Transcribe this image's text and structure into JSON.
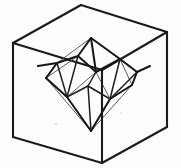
{
  "figure": {
    "title": "Icosahedron inscribed in a cube",
    "background_color": "#fdfdfc",
    "ink_color": "#1b1b1b",
    "width": 181,
    "height": 168,
    "style": "pen-and-ink wireframe diagram",
    "outer_solid": {
      "name": "cube",
      "vertex_count": 8,
      "edge_count": 12,
      "visible_edges": 9,
      "hidden_edges": 3
    },
    "inner_solid": {
      "name": "icosahedron",
      "vertex_count": 12,
      "edge_count": 30,
      "face_count": 20
    }
  },
  "geometry": {
    "cube_vertices": {
      "top_back_left": [
        13,
        43
      ],
      "top_back_right": [
        81,
        5
      ],
      "top_front_right": [
        167,
        32
      ],
      "top_front_left": [
        102,
        70
      ],
      "bottom_back_left": [
        13,
        137
      ],
      "bottom_back_right": [
        81,
        99
      ],
      "bottom_front_right": [
        167,
        127
      ],
      "bottom_front_left": [
        102,
        163
      ]
    },
    "cube_edges_visible": [
      [
        "top_back_left",
        "top_back_right"
      ],
      [
        "top_back_right",
        "top_front_right"
      ],
      [
        "top_front_right",
        "top_front_left"
      ],
      [
        "top_front_left",
        "top_back_left"
      ],
      [
        "top_back_left",
        "bottom_back_left"
      ],
      [
        "top_front_right",
        "bottom_front_right"
      ],
      [
        "top_front_left",
        "bottom_front_left"
      ],
      [
        "bottom_back_left",
        "bottom_front_left"
      ],
      [
        "bottom_front_left",
        "bottom_front_right"
      ]
    ],
    "cube_edges_hidden": [
      [
        "top_back_right",
        "bottom_back_right"
      ],
      [
        "bottom_back_left",
        "bottom_back_right"
      ],
      [
        "bottom_back_right",
        "bottom_front_right"
      ]
    ],
    "icosahedron_vertices": {
      "apex_top": [
        91,
        38
      ],
      "apex_bottom": [
        91,
        131
      ],
      "upper_a": [
        57,
        63
      ],
      "upper_b": [
        78,
        56
      ],
      "upper_c": [
        120,
        59
      ],
      "upper_d": [
        137,
        72
      ],
      "upper_e": [
        96,
        72
      ],
      "lower_a": [
        46,
        78
      ],
      "lower_b": [
        67,
        97
      ],
      "lower_c": [
        110,
        99
      ],
      "lower_d": [
        132,
        85
      ],
      "lower_e": [
        88,
        86
      ]
    },
    "icosahedron_edges_front": [
      [
        "apex_top",
        "upper_b"
      ],
      [
        "apex_top",
        "upper_c"
      ],
      [
        "apex_top",
        "upper_e"
      ],
      [
        "upper_a",
        "upper_b"
      ],
      [
        "upper_c",
        "upper_d"
      ],
      [
        "upper_a",
        "lower_a"
      ],
      [
        "upper_d",
        "lower_d"
      ],
      [
        "lower_a",
        "lower_b"
      ],
      [
        "lower_c",
        "lower_d"
      ],
      [
        "lower_b",
        "apex_bottom"
      ],
      [
        "lower_c",
        "apex_bottom"
      ],
      [
        "upper_b",
        "upper_e"
      ],
      [
        "upper_c",
        "upper_e"
      ],
      [
        "lower_b",
        "lower_e"
      ],
      [
        "lower_c",
        "lower_e"
      ],
      [
        "upper_e",
        "lower_e"
      ]
    ],
    "icosahedron_edges_back": [
      [
        "upper_a",
        "apex_top"
      ],
      [
        "upper_d",
        "apex_top"
      ],
      [
        "lower_a",
        "apex_bottom"
      ],
      [
        "lower_d",
        "apex_bottom"
      ],
      [
        "upper_a",
        "lower_b"
      ],
      [
        "upper_b",
        "lower_b"
      ],
      [
        "upper_c",
        "lower_c"
      ],
      [
        "upper_d",
        "lower_c"
      ],
      [
        "upper_b",
        "lower_e"
      ],
      [
        "upper_c",
        "lower_e"
      ],
      [
        "upper_e",
        "lower_b"
      ],
      [
        "upper_e",
        "lower_c"
      ],
      [
        "lower_a",
        "upper_b"
      ],
      [
        "lower_d",
        "upper_c"
      ]
    ]
  }
}
